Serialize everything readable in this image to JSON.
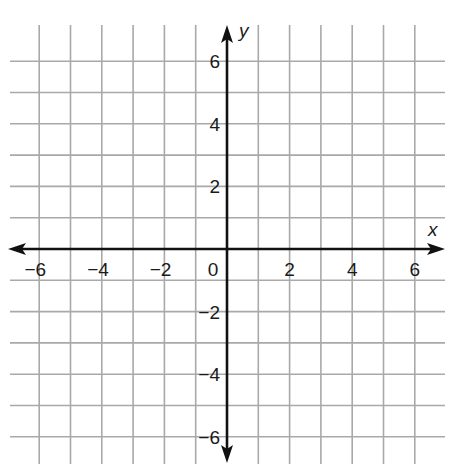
{
  "diagram": {
    "type": "coordinate-plane",
    "x_axis_label": "x",
    "y_axis_label": "y",
    "x_range": [
      -6.5,
      6.5
    ],
    "y_range": [
      -6.5,
      6.5
    ],
    "grid_step": 1,
    "x_tick_labels": [
      {
        "value": -6,
        "text": "−6"
      },
      {
        "value": -4,
        "text": "−4"
      },
      {
        "value": -2,
        "text": "−2"
      },
      {
        "value": 0,
        "text": "0"
      },
      {
        "value": 2,
        "text": "2"
      },
      {
        "value": 4,
        "text": "4"
      },
      {
        "value": 6,
        "text": "6"
      }
    ],
    "y_tick_labels": [
      {
        "value": 6,
        "text": "6"
      },
      {
        "value": 4,
        "text": "4"
      },
      {
        "value": 2,
        "text": "2"
      },
      {
        "value": -2,
        "text": "−2"
      },
      {
        "value": -4,
        "text": "−4"
      },
      {
        "value": -6,
        "text": "−6"
      }
    ],
    "colors": {
      "grid": "#a9a9a9",
      "axis": "#111111",
      "background": "#ffffff"
    }
  }
}
